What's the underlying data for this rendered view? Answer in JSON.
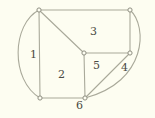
{
  "figure": {
    "kind": "planar-graph-diagram",
    "background_color": "#fdfdf1",
    "edge_color": "#a9a99a",
    "vertex_fill_color": "#fdfdf1",
    "vertex_stroke_color": "#8f8f82",
    "label_color": "#4a4a42",
    "width": 155,
    "height": 118
  },
  "vertices": [
    {
      "id": "v-top-left",
      "name": "vertex-top-left",
      "x": 39,
      "y": 10
    },
    {
      "id": "v-top-right",
      "name": "vertex-top-right",
      "x": 130,
      "y": 10
    },
    {
      "id": "v-center",
      "name": "vertex-center",
      "x": 84,
      "y": 53
    },
    {
      "id": "v-right-mid",
      "name": "vertex-right-middle",
      "x": 130,
      "y": 53
    },
    {
      "id": "v-bottom-left",
      "name": "vertex-bottom-left",
      "x": 40,
      "y": 98
    },
    {
      "id": "v-bottom-center",
      "name": "vertex-bottom-center",
      "x": 85,
      "y": 98
    }
  ],
  "edges": [
    {
      "name": "edge-top-left-to-top-right",
      "type": "line",
      "path": "M 39 10 L 130 10"
    },
    {
      "name": "edge-top-left-to-bottom-left",
      "type": "line",
      "path": "M 39 10 L 40 98"
    },
    {
      "name": "edge-top-left-to-center",
      "type": "line",
      "path": "M 39 10 L 84 53"
    },
    {
      "name": "edge-center-to-right-middle",
      "type": "line",
      "path": "M 84 53 L 130 53"
    },
    {
      "name": "edge-top-right-to-right-middle",
      "type": "line",
      "path": "M 130 10 L 130 53"
    },
    {
      "name": "edge-center-to-bottom-center",
      "type": "line",
      "path": "M 84 53 L 85 98"
    },
    {
      "name": "edge-bottom-left-to-bottom-center",
      "type": "line",
      "path": "M 40 98 L 85 98"
    },
    {
      "name": "edge-right-middle-to-bottom-center",
      "type": "line",
      "path": "M 130 53 L 85 98"
    },
    {
      "name": "edge-outer-left-curve",
      "type": "curve",
      "path": "M 39 10 C 12 24, 10 80, 40 98"
    },
    {
      "name": "edge-outer-right-curve",
      "type": "curve",
      "path": "M 130 10 C 148 26, 147 82, 85 98"
    }
  ],
  "face_labels": [
    {
      "name": "face-label-1",
      "text": "1",
      "x": 30,
      "y": 49
    },
    {
      "name": "face-label-2",
      "text": "2",
      "x": 58,
      "y": 69
    },
    {
      "name": "face-label-3",
      "text": "3",
      "x": 90,
      "y": 26
    },
    {
      "name": "face-label-4",
      "text": "4",
      "x": 121,
      "y": 62
    },
    {
      "name": "face-label-5",
      "text": "5",
      "x": 93,
      "y": 60
    },
    {
      "name": "face-label-6",
      "text": "6",
      "x": 76,
      "y": 100
    }
  ]
}
